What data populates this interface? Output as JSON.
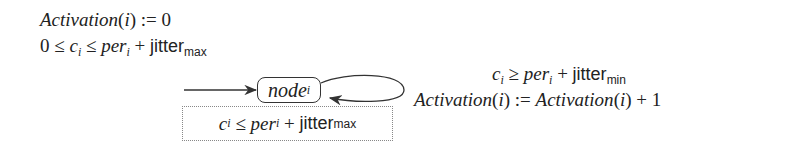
{
  "diagram": {
    "type": "timed-automaton",
    "initialization": {
      "line1": {
        "fn": "Activation",
        "arg": "i",
        "op": ":=",
        "value": "0"
      },
      "line2": {
        "lhs": "0",
        "op1": "≤",
        "var": "c",
        "var_sub": "i",
        "op2": "≤",
        "per": "per",
        "per_sub": "i",
        "plus": "+",
        "jitter": "jitter",
        "jitter_sub": "max"
      }
    },
    "node": {
      "name": "node",
      "sub": "i"
    },
    "invariant": {
      "var": "c",
      "var_sub": "i",
      "op": "≤",
      "per": "per",
      "per_sub": "i",
      "plus": "+",
      "jitter": "jitter",
      "jitter_sub": "max"
    },
    "self_loop": {
      "guard": {
        "var": "c",
        "var_sub": "i",
        "op": "≥",
        "per": "per",
        "per_sub": "i",
        "plus": "+",
        "jitter": "jitter",
        "jitter_sub": "min"
      },
      "update": {
        "lhs_fn": "Activation",
        "lhs_arg": "i",
        "op": ":=",
        "rhs_fn": "Activation",
        "rhs_arg": "i",
        "plus": "+",
        "inc": "1"
      }
    },
    "colors": {
      "stroke": "#333333",
      "dotted_border": "#888888",
      "text": "#222222"
    }
  }
}
